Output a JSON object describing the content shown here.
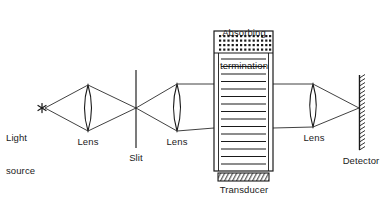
{
  "figure": {
    "title_semantic": "acousto-optic-light-diffraction-apparatus",
    "background_color": "#ffffff",
    "ink_color": "#1a1a1a",
    "width": 385,
    "height": 200
  },
  "labels": {
    "light_source_line1": "Light",
    "light_source_line2": "source",
    "lens1": "Lens",
    "slit": "Slit",
    "lens2": "Lens",
    "absorbing_line1": "Absorbing",
    "absorbing_line2": "termination",
    "transducer": "Transducer",
    "lens3": "Lens",
    "detector": "Detector"
  },
  "components": {
    "light_source": {
      "name": "light-source-star",
      "glyph": "asterisk",
      "x": 42,
      "y": 108
    },
    "lens1": {
      "name": "lens-1",
      "cx": 88,
      "top": 85,
      "bottom": 131,
      "bulge": 7
    },
    "slit": {
      "name": "slit-aperture",
      "x": 136,
      "top": 70,
      "bottom": 148
    },
    "lens2": {
      "name": "lens-2",
      "cx": 177,
      "top": 84,
      "bottom": 131,
      "bulge": 7
    },
    "column": {
      "name": "acoustic-cell-column",
      "left": 214,
      "right": 273,
      "top": 53,
      "bottom": 171,
      "wave_line_count": 15,
      "wave_line_color": "#1a1a1a"
    },
    "absorbing_termination": {
      "name": "absorbing-termination-block",
      "left": 214,
      "right": 273,
      "top": 31,
      "bottom": 53,
      "dot_columns": 13,
      "dot_rows": 4
    },
    "transducer": {
      "name": "transducer-block",
      "left": 218,
      "right": 269,
      "top": 173,
      "bottom": 181,
      "hatch": "diagonal"
    },
    "lens3": {
      "name": "lens-3",
      "cx": 313,
      "top": 84,
      "bottom": 127,
      "bulge": 6.5
    },
    "detector": {
      "name": "detector-screen",
      "x": 360,
      "top": 75,
      "bottom": 150,
      "hatch": "right-side"
    },
    "beam": {
      "name": "light-beam-rays",
      "upper_parallel_y": 84,
      "lower_parallel_y": 128,
      "focus_x": 136,
      "focus_y": 108,
      "detector_focus_y": 108
    }
  },
  "colors": {
    "ink": "#1a1a1a",
    "background": "#ffffff",
    "line": "#2b2b2b"
  }
}
